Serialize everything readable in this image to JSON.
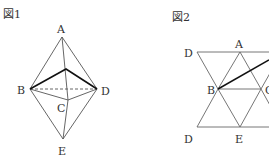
{
  "figure1": {
    "caption": "図1",
    "labels": {
      "A": "A",
      "B": "B",
      "C": "C",
      "D": "D",
      "E": "E"
    }
  },
  "figure2": {
    "caption": "図2",
    "labels": {
      "D_top": "D",
      "A": "A",
      "B": "B",
      "C": "C",
      "D_bottom": "D",
      "E": "E"
    }
  },
  "colors": {
    "line": "#555555",
    "bold": "#111111",
    "text": "#333333"
  }
}
